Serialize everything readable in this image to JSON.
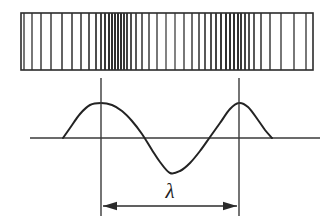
{
  "figure": {
    "background_color": "#ffffff",
    "ink_color": "#2b2b2b",
    "width": 332,
    "height": 224
  },
  "compression_panel": {
    "name": "particle-density-strip",
    "frame": {
      "x": 21,
      "y": 13,
      "width": 292,
      "height": 57
    },
    "frame_color": "#2b2b2b",
    "bar_color": "#2f2f2f",
    "bar_count": 44,
    "description": "Vertical lines bunched at compressions and spread at rarefactions",
    "bar_positions": [
      24,
      32,
      41,
      51,
      62,
      72,
      81,
      89,
      96,
      101,
      105,
      109,
      112,
      115,
      118,
      121,
      124,
      127,
      131,
      136,
      142,
      149,
      157,
      166,
      175,
      184,
      192,
      199,
      205,
      211,
      216,
      221,
      226,
      230,
      234,
      238,
      241,
      245,
      249,
      254,
      261,
      270,
      281,
      294,
      306
    ],
    "bar_widths": [
      1.3,
      1.3,
      1.4,
      1.4,
      1.5,
      1.5,
      1.5,
      1.6,
      1.7,
      1.8,
      1.9,
      2.0,
      2.0,
      2.0,
      2.0,
      2.0,
      1.9,
      1.8,
      1.7,
      1.6,
      1.5,
      1.4,
      1.3,
      1.2,
      1.2,
      1.3,
      1.4,
      1.5,
      1.6,
      1.7,
      1.8,
      1.9,
      2.0,
      2.0,
      2.0,
      2.0,
      1.9,
      1.8,
      1.7,
      1.6,
      1.5,
      1.4,
      1.3,
      1.3,
      1.3
    ]
  },
  "wave_panel": {
    "name": "displacement-wave",
    "baseline_y": 138,
    "baseline_x_start": 30,
    "baseline_x_end": 320,
    "amplitude": 35,
    "peak_y": 103,
    "trough_y": 174,
    "wave_start_x": 63,
    "wave_end_x": 272,
    "crest_1_x": 101,
    "trough_x": 170,
    "crest_2_x": 239,
    "stroke_color": "#232323"
  },
  "markers": {
    "name": "wavelength-markers",
    "left_line_x": 101,
    "right_line_x": 239,
    "line_top_y": 78,
    "line_bottom_y": 216,
    "color": "#3a3a3a"
  },
  "measurement": {
    "name": "wavelength-measurement",
    "label": "λ",
    "label_x": 170,
    "label_y": 198,
    "arrow_y": 206,
    "arrow_x_start": 103,
    "arrow_x_end": 237,
    "arrow_head_size": 7,
    "double_headed": true,
    "color": "#2b2b2b"
  },
  "chart_data": {
    "type": "line",
    "xlabel": "",
    "ylabel": "",
    "x": [
      63,
      70,
      80,
      90,
      101,
      112,
      122,
      132,
      142,
      152,
      160,
      170,
      180,
      190,
      200,
      210,
      220,
      230,
      239,
      248,
      258,
      265,
      272
    ],
    "series": [
      {
        "name": "displacement",
        "values": [
          0,
          10,
          24,
          33,
          35,
          33,
          27,
          17,
          4,
          -12,
          -24,
          -35,
          -33,
          -25,
          -13,
          1,
          15,
          29,
          35,
          31,
          18,
          8,
          0
        ]
      }
    ],
    "annotations": [
      {
        "text": "λ",
        "x_from": 101,
        "x_to": 239,
        "kind": "wavelength-span"
      }
    ],
    "axis_ranges": {
      "xlim": [
        30,
        320
      ],
      "ylim": [
        -38,
        38
      ]
    },
    "grid": false,
    "legend": "none"
  }
}
